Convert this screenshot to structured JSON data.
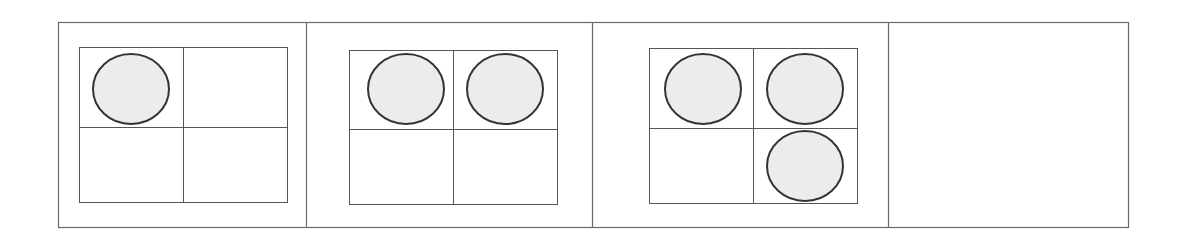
{
  "diagram": {
    "title": "",
    "colors": {
      "frame_stroke": "#6a6a6a",
      "grid_stroke": "#555555",
      "circle_fill": "#ececec",
      "circle_stroke": "#333333",
      "background": "#ffffff"
    },
    "panels": [
      {
        "index": 1,
        "has_grid": true,
        "grid": {
          "rows": 2,
          "cols": 2
        },
        "filled_cells": [
          [
            0,
            0
          ]
        ],
        "circle_count": 1
      },
      {
        "index": 2,
        "has_grid": true,
        "grid": {
          "rows": 2,
          "cols": 2
        },
        "filled_cells": [
          [
            0,
            0
          ],
          [
            0,
            1
          ]
        ],
        "circle_count": 2
      },
      {
        "index": 3,
        "has_grid": true,
        "grid": {
          "rows": 2,
          "cols": 2
        },
        "filled_cells": [
          [
            0,
            0
          ],
          [
            0,
            1
          ],
          [
            1,
            1
          ]
        ],
        "circle_count": 3
      },
      {
        "index": 4,
        "has_grid": false,
        "grid": null,
        "filled_cells": [],
        "circle_count": 0
      }
    ]
  }
}
